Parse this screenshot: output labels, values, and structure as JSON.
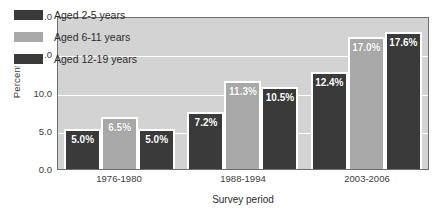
{
  "chart_data": {
    "type": "bar",
    "title": "",
    "subtitle": "",
    "xlabel": "Survey period",
    "ylabel": "Percent %",
    "categories": [
      "1976-1980",
      "1988-1994",
      "2003-2006"
    ],
    "series": [
      {
        "name": "Aged 2-5 years",
        "values": [
          5.0,
          7.2,
          12.4
        ],
        "color": "#3a3a3a",
        "labels": [
          "5.0%",
          "7.2%",
          "12.4%"
        ]
      },
      {
        "name": "Aged 6-11 years",
        "values": [
          6.5,
          11.3,
          17.0
        ],
        "color": "#a8a8a8",
        "labels": [
          "6.5%",
          "11.3%",
          "17.0%"
        ]
      },
      {
        "name": "Aged 12-19 years",
        "values": [
          5.0,
          10.5,
          17.6
        ],
        "color": "#3a3a3a",
        "labels": [
          "5.0%",
          "10.5%",
          "17.6%"
        ]
      }
    ],
    "ylim": [
      0.0,
      20.0
    ],
    "yticks": [
      "0.0",
      "5.0",
      "10.0",
      "15.0",
      "20.0"
    ],
    "ytick_values": [
      0.0,
      5.0,
      10.0,
      15.0,
      20.0
    ],
    "grid": true,
    "grid_color": "#ffffff",
    "legend_position": "top-left",
    "plot_background": "#d3d3d3",
    "page_background": "#ffffff",
    "axis_color": "#6e6e6e",
    "label_text_color": "#ffffff"
  }
}
